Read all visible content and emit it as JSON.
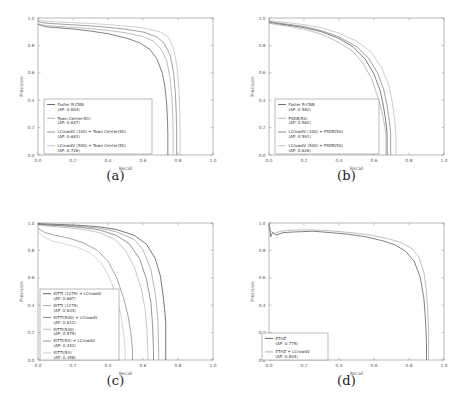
{
  "figure": {
    "panels": [
      {
        "caption": "(a)",
        "xlabel": "Recall",
        "ylabel": "Precision",
        "xticks": [
          "0.0",
          "0.2",
          "0.4",
          "0.6",
          "0.8",
          "1.0"
        ],
        "yticks": [
          "0.0",
          "0.2",
          "0.4",
          "0.6",
          "0.8",
          "1.0"
        ],
        "legend": [
          {
            "line1": "Faster R-CNN",
            "line2": "(AP: 0.604)",
            "color": "#3a3a3a"
          },
          {
            "line1": "Town Center(50)",
            "line2": "(AP: 0.647)",
            "color": "#9a9a9a"
          },
          {
            "line1": "LCrowdV (100) + Town Center(50)",
            "line2": "(AP: 0.683)",
            "color": "#6e6e6e"
          },
          {
            "line1": "LCrowdV (500) + Town Center(50)",
            "line2": "(AP: 0.726)",
            "color": "#b4b4b4"
          }
        ]
      },
      {
        "caption": "(b)",
        "xlabel": "Recall",
        "ylabel": "Precision",
        "xticks": [
          "0.0",
          "0.2",
          "0.4",
          "0.6",
          "0.8",
          "1.0"
        ],
        "yticks": [
          "0.0",
          "0.2",
          "0.4",
          "0.6",
          "0.8",
          "1.0"
        ],
        "legend": [
          {
            "line1": "Faster R-CNN",
            "line2": "(AP: 0.582)",
            "color": "#3a3a3a"
          },
          {
            "line1": "PSDB(50)",
            "line2": "(AP: 0.562)",
            "color": "#9a9a9a"
          },
          {
            "line1": "LCrowdV (100) + PSDB(50)",
            "line2": "(AP: 0.591)",
            "color": "#6e6e6e"
          },
          {
            "line1": "LCrowdV (500) + PSDB(50)",
            "line2": "(AP: 0.626)",
            "color": "#b4b4b4"
          }
        ]
      },
      {
        "caption": "(c)",
        "xlabel": "Recall",
        "ylabel": "Precision",
        "xticks": [
          "0.0",
          "0.2",
          "0.4",
          "0.6",
          "0.8",
          "1.0"
        ],
        "yticks": [
          "0.0",
          "0.2",
          "0.4",
          "0.6",
          "0.8",
          "1.0"
        ],
        "legend": [
          {
            "line1": "KITTI (1279) + LCrowdV",
            "line2": "(AP: 0.667)",
            "color": "#2f2f2f"
          },
          {
            "line1": "KITTI (1279)",
            "line2": "(AP: 0.634)",
            "color": "#8f8f8f"
          },
          {
            "line1": "KITTI(500) + LCrowdV",
            "line2": "(AP: 0.612)",
            "color": "#5c5c5c"
          },
          {
            "line1": "KITTI(500)",
            "line2": "(AP: 0.579)",
            "color": "#a8a8a8"
          },
          {
            "line1": "KITTI(50) + LCrowdV",
            "line2": "(AP: 0.442)",
            "color": "#777777"
          },
          {
            "line1": "KITTI(50)",
            "line2": "(AP: 0.358)",
            "color": "#c0c0c0"
          }
        ]
      },
      {
        "caption": "(d)",
        "xlabel": "Recall",
        "ylabel": "Precision",
        "xticks": [
          "0.0",
          "0.2",
          "0.4",
          "0.6",
          "0.8",
          "1.0"
        ],
        "yticks": [
          "0.0",
          "0.2",
          "0.4",
          "0.6",
          "0.8",
          "1.0"
        ],
        "legend": [
          {
            "line1": "ETHZ",
            "line2": "(AP: 0.779)",
            "color": "#3a3a3a"
          },
          {
            "line1": "ETHZ + LCrowdV",
            "line2": "(AP: 0.804)",
            "color": "#9a9a9a"
          }
        ]
      }
    ]
  },
  "chart_data": [
    {
      "type": "line",
      "title": "(a) Town Center precision-recall",
      "xlabel": "Recall",
      "ylabel": "Precision",
      "xlim": [
        0.0,
        1.0
      ],
      "ylim": [
        0.0,
        1.0
      ],
      "grid": false,
      "legend_position": "lower-left",
      "series": [
        {
          "name": "Faster R-CNN",
          "ap": 0.604,
          "color": "#3a3a3a",
          "x": [
            0.0,
            0.02,
            0.05,
            0.1,
            0.2,
            0.3,
            0.4,
            0.5,
            0.58,
            0.64,
            0.68,
            0.71,
            0.725,
            0.735,
            0.74,
            0.742
          ],
          "y": [
            0.955,
            0.945,
            0.935,
            0.93,
            0.92,
            0.905,
            0.885,
            0.855,
            0.82,
            0.77,
            0.7,
            0.6,
            0.5,
            0.38,
            0.25,
            0.15
          ]
        },
        {
          "name": "Town Center(50)",
          "ap": 0.647,
          "color": "#9a9a9a",
          "x": [
            0.0,
            0.02,
            0.05,
            0.1,
            0.2,
            0.3,
            0.4,
            0.5,
            0.6,
            0.66,
            0.7,
            0.735,
            0.755,
            0.765,
            0.77,
            0.772
          ],
          "y": [
            0.96,
            0.95,
            0.945,
            0.94,
            0.932,
            0.922,
            0.91,
            0.892,
            0.865,
            0.83,
            0.78,
            0.69,
            0.56,
            0.42,
            0.28,
            0.15
          ]
        },
        {
          "name": "LCrowdV (100) + Town Center(50)",
          "ap": 0.683,
          "color": "#6e6e6e",
          "x": [
            0.0,
            0.02,
            0.05,
            0.1,
            0.2,
            0.3,
            0.4,
            0.5,
            0.6,
            0.68,
            0.72,
            0.755,
            0.775,
            0.785,
            0.79,
            0.792
          ],
          "y": [
            0.975,
            0.968,
            0.962,
            0.958,
            0.95,
            0.942,
            0.932,
            0.918,
            0.898,
            0.862,
            0.818,
            0.73,
            0.6,
            0.45,
            0.3,
            0.16
          ]
        },
        {
          "name": "LCrowdV (500) + Town Center(50)",
          "ap": 0.726,
          "color": "#b4b4b4",
          "x": [
            0.0,
            0.02,
            0.05,
            0.1,
            0.2,
            0.3,
            0.4,
            0.5,
            0.6,
            0.7,
            0.745,
            0.775,
            0.795,
            0.805,
            0.81,
            0.812
          ],
          "y": [
            0.985,
            0.98,
            0.976,
            0.972,
            0.966,
            0.96,
            0.952,
            0.942,
            0.928,
            0.898,
            0.86,
            0.78,
            0.64,
            0.48,
            0.32,
            0.17
          ]
        }
      ]
    },
    {
      "type": "line",
      "title": "(b) PSDB precision-recall",
      "xlabel": "Recall",
      "ylabel": "Precision",
      "xlim": [
        0.0,
        1.0
      ],
      "ylim": [
        0.0,
        1.0
      ],
      "grid": false,
      "legend_position": "lower-left",
      "series": [
        {
          "name": "Faster R-CNN",
          "ap": 0.582,
          "color": "#3a3a3a",
          "x": [
            0.0,
            0.05,
            0.1,
            0.2,
            0.3,
            0.4,
            0.48,
            0.55,
            0.6,
            0.635,
            0.655,
            0.668,
            0.675
          ],
          "y": [
            0.97,
            0.958,
            0.95,
            0.93,
            0.9,
            0.85,
            0.79,
            0.7,
            0.59,
            0.47,
            0.35,
            0.24,
            0.155
          ]
        },
        {
          "name": "PSDB(50)",
          "ap": 0.562,
          "color": "#9a9a9a",
          "x": [
            0.0,
            0.05,
            0.1,
            0.2,
            0.3,
            0.4,
            0.48,
            0.54,
            0.59,
            0.62,
            0.645,
            0.66,
            0.668
          ],
          "y": [
            0.962,
            0.95,
            0.942,
            0.918,
            0.882,
            0.822,
            0.755,
            0.665,
            0.545,
            0.43,
            0.32,
            0.22,
            0.15
          ]
        },
        {
          "name": "LCrowdV (100) + PSDB(50)",
          "ap": 0.591,
          "color": "#6e6e6e",
          "x": [
            0.0,
            0.05,
            0.1,
            0.2,
            0.3,
            0.4,
            0.5,
            0.57,
            0.62,
            0.655,
            0.675,
            0.688,
            0.695
          ],
          "y": [
            0.975,
            0.964,
            0.956,
            0.938,
            0.908,
            0.862,
            0.792,
            0.705,
            0.6,
            0.48,
            0.355,
            0.245,
            0.16
          ]
        },
        {
          "name": "LCrowdV (500) + PSDB(50)",
          "ap": 0.626,
          "color": "#b4b4b4",
          "x": [
            0.0,
            0.05,
            0.1,
            0.2,
            0.3,
            0.4,
            0.5,
            0.58,
            0.64,
            0.685,
            0.705,
            0.718,
            0.725
          ],
          "y": [
            0.982,
            0.974,
            0.968,
            0.952,
            0.928,
            0.89,
            0.832,
            0.755,
            0.645,
            0.51,
            0.38,
            0.26,
            0.145
          ]
        }
      ]
    },
    {
      "type": "line",
      "title": "(c) KITTI precision-recall",
      "xlabel": "Recall",
      "ylabel": "Precision",
      "xlim": [
        0.0,
        1.0
      ],
      "ylim": [
        0.0,
        1.0
      ],
      "grid": false,
      "legend_position": "lower-left",
      "series": [
        {
          "name": "KITTI (1279) + LCrowdV",
          "ap": 0.667,
          "color": "#2f2f2f",
          "x": [
            0.0,
            0.05,
            0.15,
            0.25,
            0.35,
            0.45,
            0.55,
            0.62,
            0.67,
            0.7,
            0.715,
            0.725,
            0.73
          ],
          "y": [
            0.995,
            0.992,
            0.988,
            0.982,
            0.972,
            0.952,
            0.91,
            0.845,
            0.74,
            0.61,
            0.47,
            0.35,
            0.27
          ]
        },
        {
          "name": "KITTI (1279)",
          "ap": 0.634,
          "color": "#8f8f8f",
          "x": [
            0.0,
            0.05,
            0.15,
            0.25,
            0.35,
            0.45,
            0.55,
            0.6,
            0.645,
            0.672,
            0.685,
            0.69
          ],
          "y": [
            0.992,
            0.988,
            0.982,
            0.975,
            0.962,
            0.935,
            0.88,
            0.805,
            0.66,
            0.47,
            0.3,
            0.06
          ]
        },
        {
          "name": "KITTI(500) + LCrowdV",
          "ap": 0.612,
          "color": "#5c5c5c",
          "x": [
            0.0,
            0.05,
            0.15,
            0.25,
            0.35,
            0.45,
            0.52,
            0.58,
            0.62,
            0.645,
            0.655,
            0.66
          ],
          "y": [
            0.99,
            0.985,
            0.978,
            0.968,
            0.95,
            0.908,
            0.85,
            0.74,
            0.59,
            0.42,
            0.25,
            0.06
          ]
        },
        {
          "name": "KITTI(500)",
          "ap": 0.579,
          "color": "#a8a8a8",
          "x": [
            0.0,
            0.05,
            0.15,
            0.25,
            0.35,
            0.44,
            0.5,
            0.55,
            0.59,
            0.612,
            0.622,
            0.628
          ],
          "y": [
            0.985,
            0.978,
            0.968,
            0.955,
            0.93,
            0.88,
            0.8,
            0.68,
            0.52,
            0.37,
            0.23,
            0.06
          ]
        },
        {
          "name": "KITTI(50) + LCrowdV",
          "ap": 0.442,
          "color": "#777777",
          "x": [
            0.0,
            0.04,
            0.1,
            0.18,
            0.26,
            0.34,
            0.4,
            0.45,
            0.49,
            0.515,
            0.53,
            0.54
          ],
          "y": [
            0.96,
            0.93,
            0.91,
            0.888,
            0.855,
            0.8,
            0.72,
            0.6,
            0.45,
            0.32,
            0.2,
            0.085
          ]
        },
        {
          "name": "KITTI(50)",
          "ap": 0.358,
          "color": "#c0c0c0",
          "x": [
            0.0,
            0.03,
            0.08,
            0.15,
            0.22,
            0.3,
            0.36,
            0.41,
            0.45,
            0.475,
            0.49,
            0.498
          ],
          "y": [
            0.94,
            0.9,
            0.868,
            0.848,
            0.825,
            0.782,
            0.71,
            0.6,
            0.45,
            0.32,
            0.19,
            0.07
          ]
        }
      ]
    },
    {
      "type": "line",
      "title": "(d) ETHZ precision-recall",
      "xlabel": "Recall",
      "ylabel": "Precision",
      "xlim": [
        0.0,
        1.0
      ],
      "ylim": [
        0.0,
        1.0
      ],
      "grid": false,
      "legend_position": "lower-left",
      "series": [
        {
          "name": "ETHZ",
          "ap": 0.779,
          "color": "#3a3a3a",
          "x": [
            0.0,
            0.01,
            0.02,
            0.04,
            0.08,
            0.15,
            0.25,
            0.35,
            0.45,
            0.55,
            0.65,
            0.72,
            0.78,
            0.83,
            0.865,
            0.885,
            0.895,
            0.9
          ],
          "y": [
            0.995,
            0.9,
            0.93,
            0.912,
            0.93,
            0.935,
            0.94,
            0.93,
            0.918,
            0.9,
            0.87,
            0.84,
            0.795,
            0.72,
            0.6,
            0.45,
            0.28,
            0.12
          ]
        },
        {
          "name": "ETHZ + LCrowdV",
          "ap": 0.804,
          "color": "#9a9a9a",
          "x": [
            0.0,
            0.01,
            0.03,
            0.06,
            0.1,
            0.18,
            0.28,
            0.38,
            0.48,
            0.58,
            0.68,
            0.75,
            0.81,
            0.855,
            0.885,
            0.9,
            0.908,
            0.912
          ],
          "y": [
            0.998,
            0.94,
            0.925,
            0.938,
            0.945,
            0.95,
            0.948,
            0.94,
            0.928,
            0.912,
            0.885,
            0.86,
            0.82,
            0.755,
            0.64,
            0.5,
            0.34,
            0.23
          ]
        }
      ]
    }
  ]
}
